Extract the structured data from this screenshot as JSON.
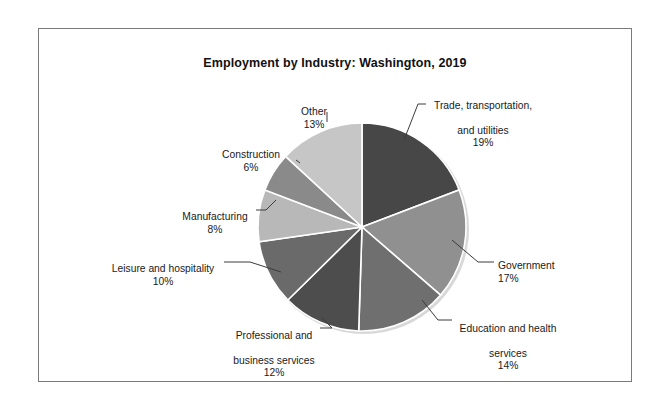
{
  "chart_data": {
    "type": "pie",
    "title": "Employment by Industry: Washington, 2019",
    "xlabel": "",
    "ylabel": "",
    "legend_position": "none",
    "grid": false,
    "categories": [
      "Trade, transportation, and utilities",
      "Government",
      "Education and health services",
      "Professional and business services",
      "Leisure and hospitality",
      "Manufacturing",
      "Construction",
      "Other"
    ],
    "values": [
      19,
      17,
      14,
      12,
      10,
      8,
      6,
      13
    ],
    "value_unit": "%",
    "slices": [
      {
        "label": "Trade, transportation,\nand utilities",
        "value": 19,
        "value_text": "19%",
        "color": "#474747"
      },
      {
        "label": "Government",
        "value": 17,
        "value_text": "17%",
        "color": "#909090"
      },
      {
        "label": "Education and health\nservices",
        "value": 14,
        "value_text": "14%",
        "color": "#6f6f6f"
      },
      {
        "label": "Professional and\nbusiness services",
        "value": 12,
        "value_text": "12%",
        "color": "#4d4d4d"
      },
      {
        "label": "Leisure and hospitality",
        "value": 10,
        "value_text": "10%",
        "color": "#6a6a6a"
      },
      {
        "label": "Manufacturing",
        "value": 8,
        "value_text": "8%",
        "color": "#b8b8b8"
      },
      {
        "label": "Construction",
        "value": 6,
        "value_text": "6%",
        "color": "#8a8a8a"
      },
      {
        "label": "Other",
        "value": 13,
        "value_text": "13%",
        "color": "#c6c6c6"
      }
    ]
  },
  "labels": {
    "trade": {
      "line1": "Trade, transportation,",
      "line2": "and utilities",
      "pct": "19%"
    },
    "government": {
      "line1": "Government",
      "pct": "17%"
    },
    "education": {
      "line1": "Education and health",
      "line2": "services",
      "pct": "14%"
    },
    "professional": {
      "line1": "Professional and",
      "line2": "business services",
      "pct": "12%"
    },
    "leisure": {
      "line1": "Leisure and hospitality",
      "pct": "10%"
    },
    "manufacturing": {
      "line1": "Manufacturing",
      "pct": "8%"
    },
    "construction": {
      "line1": "Construction",
      "pct": "6%"
    },
    "other": {
      "line1": "Other",
      "pct": "13%"
    }
  },
  "colors": {
    "frame_border": "#7a7a7a",
    "background": "#ffffff",
    "text": "#1a1a1a",
    "leader_line": "#3c3c3c",
    "slice_divider": "#ffffff"
  }
}
